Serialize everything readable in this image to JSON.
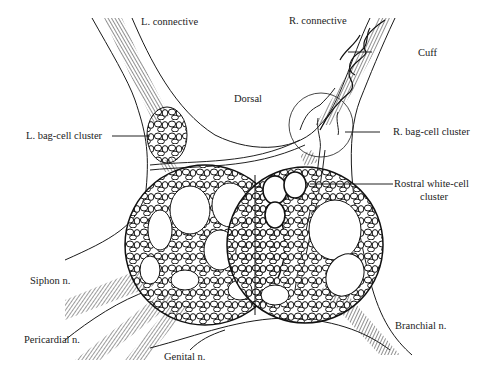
{
  "diagram": {
    "labels": {
      "l_connective": "L. connective",
      "r_connective": "R. connective",
      "cuff": "Cuff",
      "dorsal": "Dorsal",
      "l_bag_cell": "L. bag-cell cluster",
      "r_bag_cell": "R. bag-cell cluster",
      "rostral_white_1": "Rostral white-cell",
      "rostral_white_2": "cluster",
      "siphon": "Siphon n.",
      "pericardial": "Pericardial n.",
      "genital": "Genital n.",
      "branchial": "Branchial n."
    },
    "colors": {
      "line": "#1a1a1a",
      "background": "#ffffff"
    }
  }
}
